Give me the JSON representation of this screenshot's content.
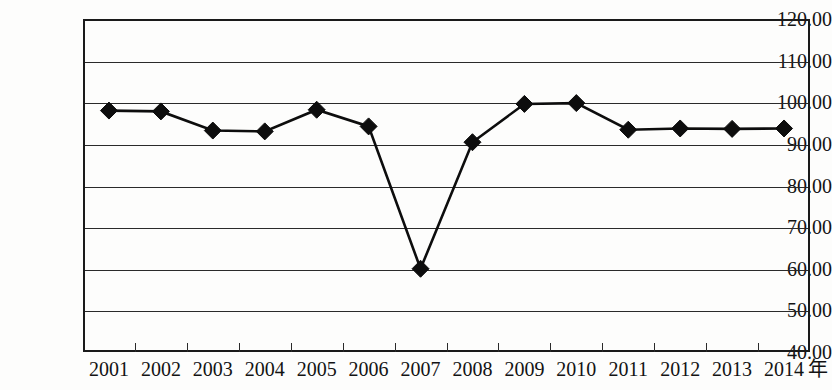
{
  "chart_data": {
    "type": "line",
    "title": "",
    "subtitle": "",
    "xlabel": "年",
    "ylabel": "",
    "categories": [
      "2001",
      "2002",
      "2003",
      "2004",
      "2005",
      "2006",
      "2007",
      "2008",
      "2009",
      "2010",
      "2011",
      "2012",
      "2013",
      "2014"
    ],
    "values": [
      98.0,
      97.8,
      93.2,
      93.0,
      98.2,
      94.2,
      60.0,
      90.4,
      99.6,
      99.8,
      93.4,
      93.7,
      93.6,
      93.7
    ],
    "series": [
      {
        "name": "",
        "values": [
          98.0,
          97.8,
          93.2,
          93.0,
          98.2,
          94.2,
          60.0,
          90.4,
          99.6,
          99.8,
          93.4,
          93.7,
          93.6,
          93.7
        ]
      }
    ],
    "ylim": [
      40.0,
      120.0
    ],
    "ytick_step": 10,
    "ytick_labels": [
      "120.00",
      "110.00",
      "100.00",
      "90.00",
      "80.00",
      "70.00",
      "60.00",
      "50.00",
      "40.00"
    ],
    "ytick_values": [
      120,
      110,
      100,
      90,
      80,
      70,
      60,
      50,
      40
    ],
    "grid": true,
    "grid_axis": "y",
    "legend": false,
    "legend_position": "none",
    "marker": "diamond",
    "line_color": "#0d0d0d",
    "marker_color": "#0d0d0d",
    "grid_color": "#2a2a2a",
    "background_color": "#ffffff",
    "annotations": []
  },
  "axis": {
    "x_unit_label": "年"
  }
}
